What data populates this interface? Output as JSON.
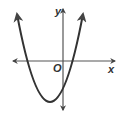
{
  "diagram": {
    "type": "coordinate-graph",
    "labels": {
      "y_axis": "y",
      "x_axis": "x",
      "origin": "O"
    },
    "curve": {
      "kind": "parabola",
      "opens": "up",
      "vertex_quadrant": "III",
      "x_intercepts": "one negative, one positive",
      "y_intercept": "negative"
    },
    "colors": {
      "axis": "#555555",
      "curve": "#333333",
      "background": "#ffffff"
    }
  }
}
